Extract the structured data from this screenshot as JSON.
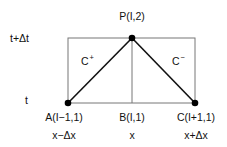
{
  "diagram": {
    "type": "characteristics-grid",
    "axis_labels": {
      "t_upper": "t+Δt",
      "t_lower": "t"
    },
    "points": [
      {
        "id": "P",
        "label": "P(I,2)",
        "x_label": ""
      },
      {
        "id": "A",
        "label": "A(I−1,1)",
        "x_label": "x−Δx"
      },
      {
        "id": "B",
        "label": "B(I,1)",
        "x_label": "x"
      },
      {
        "id": "C",
        "label": "C(I+1,1)",
        "x_label": "x+Δx"
      }
    ],
    "characteristics": [
      {
        "name": "C",
        "sign": "+",
        "from": "A",
        "to": "P"
      },
      {
        "name": "C",
        "sign": "−",
        "from": "C",
        "to": "P"
      }
    ],
    "colors": {
      "line": "#111111",
      "box": "#777777",
      "point": "#000000"
    }
  }
}
